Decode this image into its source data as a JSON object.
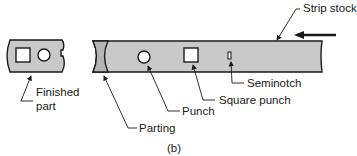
{
  "figure": {
    "caption": "(b)",
    "colors": {
      "stock_fill": "#c9c9c9",
      "outline": "#1a1a1a",
      "hole_fill": "#ffffff"
    }
  },
  "labels": {
    "strip_stock": "Strip stock",
    "seminotch": "Seminotch",
    "square_punch": "Square punch",
    "punch": "Punch",
    "parting": "Parting",
    "finished_part_line1": "Finished",
    "finished_part_line2": "part"
  },
  "indicators": {
    "feed_direction": "left-arrow"
  }
}
